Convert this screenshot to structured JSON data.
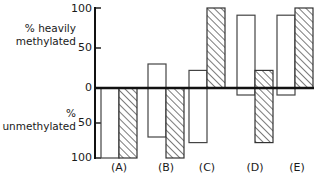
{
  "chart_data": {
    "type": "bar",
    "title": "",
    "subtitle": "",
    "xlabel": "",
    "ylabel_top": "% heavily methylated",
    "ylabel_bottom": "% unmethylated",
    "categories": [
      "(A)",
      "(B)",
      "(C)",
      "(D)",
      "(E)"
    ],
    "ylim": [
      -100,
      100
    ],
    "grid": false,
    "legend_position": "none",
    "axis_note": "Positive axis labelled 0/50/100 upward as % heavily methylated; negative axis labelled 0/50/100 downward as % unmethylated",
    "tick_labels_top": [
      "100",
      "50",
      "0"
    ],
    "tick_labels_bottom": [
      "50",
      "100"
    ],
    "tick_values": [
      100,
      50,
      0,
      -50,
      -100
    ],
    "series": [
      {
        "name": "open",
        "fill": "open",
        "values": [
          -100,
          30,
          22,
          91,
          91
        ],
        "bar_bottoms": [
          -100,
          -70,
          -78,
          -10,
          -10
        ],
        "bar_tops": [
          0,
          30,
          22,
          91,
          91
        ]
      },
      {
        "name": "hatched",
        "fill": "hatched",
        "values": [
          -100,
          -100,
          100,
          22,
          100
        ],
        "bar_bottoms": [
          -100,
          -100,
          0,
          -78,
          0
        ],
        "bar_tops": [
          0,
          0,
          100,
          22,
          100
        ]
      }
    ],
    "annotations": []
  },
  "labels": {
    "top_axis_line1": "% heavily",
    "top_axis_line2": "methylated",
    "bottom_axis_line1": "%",
    "bottom_axis_line2": "unmethylated",
    "tick_100_top": "100",
    "tick_50_top": "50",
    "tick_0": "0",
    "tick_50_bottom": "50",
    "tick_100_bottom": "100",
    "cat_a": "(A)",
    "cat_b": "(B)",
    "cat_c": "(C)",
    "cat_d": "(D)",
    "cat_e": "(E)"
  },
  "colors": {
    "ink": "#111111",
    "bar_stroke": "#3a3a3a",
    "background": "#ffffff"
  }
}
